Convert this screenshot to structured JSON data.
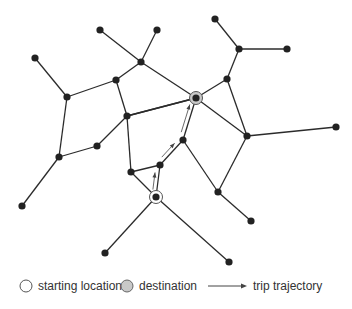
{
  "colors": {
    "edge": "#2b2b2b",
    "node": "#222222",
    "start_ring": "#555555",
    "destination_fill": "#c8c8c8",
    "arrow": "#444444",
    "legend_text": "#333333"
  },
  "nodes": [
    {
      "id": "n1",
      "x": 35,
      "y": 58
    },
    {
      "id": "n2",
      "x": 67,
      "y": 97
    },
    {
      "id": "n3",
      "x": 100,
      "y": 30
    },
    {
      "id": "n4",
      "x": 116,
      "y": 80
    },
    {
      "id": "n5",
      "x": 157,
      "y": 30
    },
    {
      "id": "n6",
      "x": 141,
      "y": 62
    },
    {
      "id": "n7",
      "x": 127,
      "y": 116
    },
    {
      "id": "n8",
      "x": 215,
      "y": 19
    },
    {
      "id": "n9",
      "x": 239,
      "y": 49
    },
    {
      "id": "n10",
      "x": 287,
      "y": 49
    },
    {
      "id": "n11",
      "x": 227,
      "y": 79
    },
    {
      "id": "n12",
      "x": 196,
      "y": 98
    },
    {
      "id": "n13",
      "x": 336,
      "y": 127
    },
    {
      "id": "n14",
      "x": 247,
      "y": 136
    },
    {
      "id": "n15",
      "x": 59,
      "y": 157
    },
    {
      "id": "n16",
      "x": 97,
      "y": 146
    },
    {
      "id": "n17",
      "x": 22,
      "y": 206
    },
    {
      "id": "n18",
      "x": 131,
      "y": 172
    },
    {
      "id": "n19",
      "x": 160,
      "y": 165
    },
    {
      "id": "n20",
      "x": 183,
      "y": 140
    },
    {
      "id": "n21",
      "x": 156,
      "y": 197
    },
    {
      "id": "n22",
      "x": 218,
      "y": 192
    },
    {
      "id": "n23",
      "x": 251,
      "y": 221
    },
    {
      "id": "n24",
      "x": 105,
      "y": 253
    },
    {
      "id": "n25",
      "x": 229,
      "y": 262
    }
  ],
  "edges": [
    [
      "n1",
      "n2"
    ],
    [
      "n2",
      "n4"
    ],
    [
      "n4",
      "n6"
    ],
    [
      "n3",
      "n6"
    ],
    [
      "n5",
      "n6"
    ],
    [
      "n6",
      "n12"
    ],
    [
      "n4",
      "n7"
    ],
    [
      "n7",
      "n12"
    ],
    [
      "n7",
      "n16"
    ],
    [
      "n2",
      "n15"
    ],
    [
      "n15",
      "n16"
    ],
    [
      "n15",
      "n17"
    ],
    [
      "n8",
      "n9"
    ],
    [
      "n9",
      "n10"
    ],
    [
      "n9",
      "n11"
    ],
    [
      "n11",
      "n12"
    ],
    [
      "n11",
      "n14"
    ],
    [
      "n12",
      "n14"
    ],
    [
      "n12",
      "n20"
    ],
    [
      "n14",
      "n13"
    ],
    [
      "n20",
      "n19"
    ],
    [
      "n19",
      "n18"
    ],
    [
      "n18",
      "n21"
    ],
    [
      "n19",
      "n21"
    ],
    [
      "n7",
      "n18"
    ],
    [
      "n20",
      "n22"
    ],
    [
      "n22",
      "n14"
    ],
    [
      "n22",
      "n23"
    ],
    [
      "n21",
      "n24"
    ],
    [
      "n21",
      "n25"
    ],
    [
      "n7",
      "n12"
    ]
  ],
  "start_node": "n21",
  "destination_node": "n12",
  "trajectory": [
    "n21",
    "n19",
    "n20",
    "n12"
  ],
  "legend": {
    "start_label": "starting location",
    "destination_label": "destination",
    "trajectory_label": "trip trajectory"
  }
}
